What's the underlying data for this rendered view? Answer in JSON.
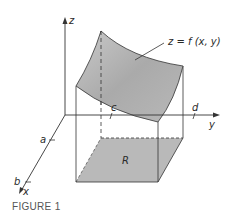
{
  "figure": {
    "caption": "FIGURE 1",
    "surface_label": "z = f (x, y)",
    "region_label": "R",
    "axes": {
      "x": "x",
      "y": "y",
      "z": "z"
    },
    "ticks": {
      "a": "a",
      "b": "b",
      "c": "c",
      "d": "d"
    },
    "colors": {
      "surface_dark": "#9c9c9c",
      "surface_light": "#c8c8c8",
      "region_fill": "#b9b9b9",
      "line": "#333333"
    }
  }
}
